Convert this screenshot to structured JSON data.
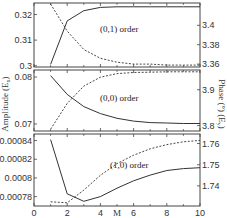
{
  "chart_data": [
    {
      "type": "line",
      "panel": "top",
      "annotation": "(0,1) order",
      "x": [
        1,
        2,
        3,
        4,
        5,
        6,
        7,
        8,
        9,
        10
      ],
      "xlim": [
        0,
        10
      ],
      "left_axis": {
        "label": "Amplitude (E_x)",
        "ylim": [
          0.2995,
          0.3245
        ],
        "ticks": [
          0.3,
          0.31,
          0.32
        ],
        "tick_labels": [
          "0.3",
          "0.31",
          "0.32"
        ]
      },
      "right_axis": {
        "label": "Phase (°) (E_y)",
        "ylim": [
          3.357,
          3.423
        ],
        "ticks": [
          3.36,
          3.38,
          3.4
        ],
        "tick_labels": [
          "3.36",
          "3.38",
          "3.4"
        ]
      },
      "series": [
        {
          "name": "Amplitude",
          "style": "solid",
          "axis": "left",
          "values": [
            0.3005,
            0.3175,
            0.3215,
            0.3228,
            0.323,
            0.323,
            0.323,
            0.323,
            0.323,
            0.323
          ]
        },
        {
          "name": "Phase",
          "style": "dashed",
          "axis": "right",
          "values": [
            3.422,
            3.394,
            3.375,
            3.366,
            3.362,
            3.36,
            3.36,
            3.359,
            3.359,
            3.359
          ]
        }
      ]
    },
    {
      "type": "line",
      "panel": "middle",
      "annotation": "(0,0) order",
      "x": [
        1,
        2,
        3,
        4,
        5,
        6,
        7,
        8,
        9,
        10
      ],
      "xlim": [
        0,
        10
      ],
      "left_axis": {
        "label": "Amplitude (E_x)",
        "ylim": [
          0.0685,
          0.0815
        ],
        "ticks": [
          0.07,
          0.08
        ],
        "tick_labels": [
          "0.07",
          "0.08"
        ]
      },
      "right_axis": {
        "label": "Phase (°) (E_y)",
        "ylim": [
          3.785,
          3.955
        ],
        "ticks": [
          3.8,
          3.9
        ],
        "tick_labels": [
          "3.8",
          "3.9"
        ]
      },
      "series": [
        {
          "name": "Amplitude",
          "style": "solid",
          "axis": "left",
          "values": [
            0.0803,
            0.0763,
            0.0737,
            0.0722,
            0.0712,
            0.0706,
            0.0703,
            0.0702,
            0.0701,
            0.0701
          ]
        },
        {
          "name": "Phase",
          "style": "dashed",
          "axis": "right",
          "values": [
            3.79,
            3.862,
            3.91,
            3.935,
            3.945,
            3.948,
            3.949,
            3.95,
            3.95,
            3.95
          ]
        }
      ]
    },
    {
      "type": "line",
      "panel": "bottom",
      "annotation": "(1,0) order",
      "x": [
        1,
        2,
        3,
        4,
        5,
        6,
        7,
        8,
        9,
        10
      ],
      "xlim": [
        0,
        10
      ],
      "xlabel": "M",
      "x_ticks": [
        0,
        2,
        4,
        6,
        8,
        10
      ],
      "x_tick_labels": [
        "0",
        "2",
        "4",
        "6",
        "8",
        "10"
      ],
      "left_axis": {
        "label": "Amplitude (E_x)",
        "ylim": [
          0.00077,
          0.000847
        ],
        "ticks": [
          0.00078,
          0.0008,
          0.00082,
          0.00084
        ],
        "tick_labels": [
          "0.00078",
          "0.0008",
          "0.00082",
          "0.00084"
        ]
      },
      "right_axis": {
        "label": "Phase (°) (E_y)",
        "ylim": [
          1.7305,
          1.7645
        ],
        "ticks": [
          1.74,
          1.75,
          1.76
        ],
        "tick_labels": [
          "1.74",
          "1.75",
          "1.76"
        ]
      },
      "series": [
        {
          "name": "Amplitude",
          "style": "solid",
          "axis": "left",
          "values": [
            0.000841,
            0.000783,
            0.000775,
            0.00078,
            0.000789,
            0.000797,
            0.000803,
            0.000808,
            0.00081,
            0.000811
          ]
        },
        {
          "name": "Phase",
          "style": "dashed",
          "axis": "right",
          "values": [
            1.7325,
            1.732,
            1.738,
            1.745,
            1.7505,
            1.7545,
            1.7575,
            1.7595,
            1.7608,
            1.7615
          ]
        }
      ]
    }
  ],
  "labels": {
    "left_axis_title": "Amplitude (E",
    "left_axis_sub": "x",
    "right_axis_title": "Phase (°) (E",
    "right_axis_sub": "y",
    "x_axis_title": "M",
    "top_annotation": "(0,1) order",
    "middle_annotation": "(0,0) order",
    "bottom_annotation": "(1,0) order"
  }
}
